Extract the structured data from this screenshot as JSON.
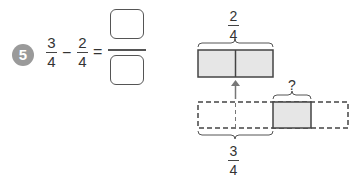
{
  "problem": {
    "number": "5",
    "first_fraction": {
      "numerator": "3",
      "denominator": "4"
    },
    "operator": "−",
    "second_fraction": {
      "numerator": "2",
      "denominator": "4"
    },
    "equals": "=",
    "answer": {
      "numerator": "",
      "denominator": ""
    }
  },
  "diagram": {
    "top_label": {
      "numerator": "2",
      "denominator": "4"
    },
    "unknown_label": "?",
    "bottom_label": {
      "numerator": "3",
      "denominator": "4"
    },
    "colors": {
      "shade": "#e6e6e6",
      "line": "#444444",
      "arrow": "#777777"
    }
  }
}
